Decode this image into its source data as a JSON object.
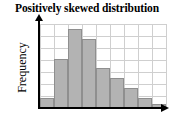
{
  "chart_data": {
    "type": "bar",
    "title": "Positively skewed distribution",
    "xlabel": "",
    "ylabel": "Frequency",
    "categories": [
      "1",
      "2",
      "3",
      "4",
      "5",
      "6",
      "7",
      "8",
      "9"
    ],
    "values": [
      1,
      5,
      8,
      7,
      4,
      3,
      2,
      1,
      0.4
    ],
    "ylim": [
      0,
      8.5
    ],
    "xlim": [
      0,
      9
    ],
    "grid": true,
    "grid_color": "#cfcfcf",
    "legend": null,
    "legend_position": "none",
    "bar_fill_color": "#b3b3b3",
    "bar_border_color": "#8f8f8f",
    "axis_color": "#000000",
    "x_tick_labels": [],
    "y_tick_labels": [],
    "annotations": [],
    "grid_rows": 7,
    "grid_cols": 9
  },
  "axes": {
    "y_axis_name": "Frequency",
    "x_axis_name": ""
  },
  "icons": {
    "y_axis_arrow": "arrow-up-icon",
    "x_axis_arrow": "arrow-right-icon"
  }
}
